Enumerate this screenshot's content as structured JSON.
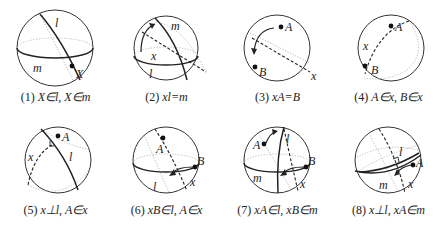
{
  "figure": {
    "panels": [
      {
        "number": "(1)",
        "expression": "X∈l, X∈m",
        "labels": {
          "line1": "l",
          "line2": "m",
          "point1": "X"
        }
      },
      {
        "number": "(2)",
        "expression": "xl=m",
        "labels": {
          "line1": "m",
          "line2": "l",
          "reflector": "x"
        }
      },
      {
        "number": "(3)",
        "expression": "xA=B",
        "labels": {
          "point1": "A",
          "point2": "B",
          "reflector": "x"
        }
      },
      {
        "number": "(4)",
        "expression": "A∈x, B∈x",
        "labels": {
          "point1": "A",
          "point2": "B",
          "reflector": "x"
        }
      },
      {
        "number": "(5)",
        "expression": "x⊥l, A∈x",
        "labels": {
          "point1": "A",
          "line1": "l",
          "reflector": "x"
        }
      },
      {
        "number": "(6)",
        "expression": "xB∈l, A∈x",
        "labels": {
          "point1": "A",
          "point2": "B",
          "line1": "l",
          "reflector": "x"
        }
      },
      {
        "number": "(7)",
        "expression": "xA∈l, xB∈m",
        "labels": {
          "point1": "A",
          "point2": "B",
          "line1": "l",
          "line2": "m",
          "reflector": "x"
        }
      },
      {
        "number": "(8)",
        "expression": "x⊥l, xA∈m",
        "labels": {
          "point1": "A",
          "line1": "l",
          "line2": "m",
          "reflector": "x"
        }
      }
    ]
  },
  "colors": {
    "stroke": "#222222",
    "hidden": "#aaaaaa",
    "background": "#ffffff"
  }
}
